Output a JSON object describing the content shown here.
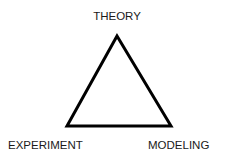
{
  "diagram": {
    "type": "triangle",
    "vertices": {
      "top": "THEORY",
      "bottom_left": "EXPERIMENT",
      "bottom_right": "MODELING"
    },
    "stroke_color": "#000000",
    "background": "#ffffff"
  }
}
